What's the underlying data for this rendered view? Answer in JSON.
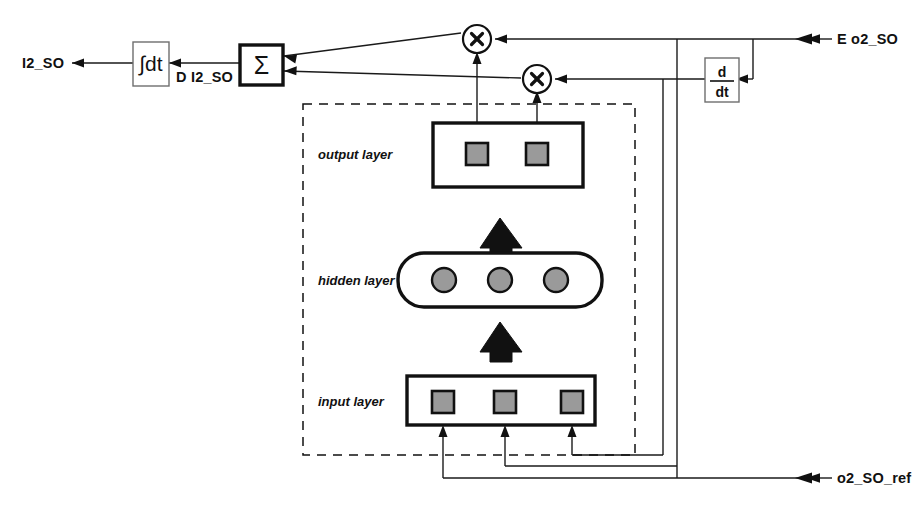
{
  "diagram": {
    "colors": {
      "line": "#1a1a1a",
      "node_fill": "#9a9a9a",
      "box_stroke": "#111111",
      "background": "#ffffff"
    },
    "signals": {
      "output_label": "I2_SO",
      "derivative_label": "D I2_SO",
      "error_label": "E o2_SO",
      "reference_label": "o2_SO_ref"
    },
    "blocks": {
      "integrator_label": "∫dt",
      "integrator_name": "integrator",
      "summer_label": "Σ",
      "summer_name": "summing-junction",
      "derivative_numerator": "d",
      "derivative_denominator": "dt",
      "derivative_name": "derivative-block",
      "multiplier_glyph": "⊗"
    },
    "network": {
      "container_name": "neural-network",
      "layers": [
        {
          "label": "output layer",
          "shape": "rect",
          "nodes": 2,
          "node_shape": "square"
        },
        {
          "label": "hidden layer",
          "shape": "rounded",
          "nodes": 3,
          "node_shape": "circle"
        },
        {
          "label": "input layer",
          "shape": "rect",
          "nodes": 3,
          "node_shape": "square"
        }
      ]
    }
  }
}
